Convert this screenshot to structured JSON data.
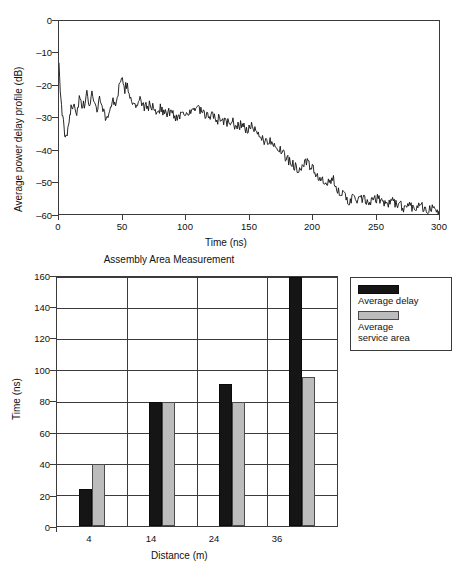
{
  "chart_data": [
    {
      "id": "power-delay-profile",
      "type": "line",
      "title": "",
      "xlabel": "Time (ns)",
      "ylabel": "Average power delay profile (dB)",
      "xlim": [
        0,
        300
      ],
      "ylim": [
        -60,
        0
      ],
      "xticks": [
        "0",
        "50",
        "100",
        "150",
        "200",
        "250",
        "300"
      ],
      "yticks": [
        "0",
        "–10",
        "–20",
        "–30",
        "–40",
        "–50",
        "–60"
      ],
      "grid": false,
      "legend": "none",
      "series": [
        {
          "name": "Average power delay profile",
          "color": "#111111",
          "description": "Noisy impulse response: sharp onset near t=0 rising from about -37 dB, a noisy plateau between -22 and -31 dB from 5 to 115 ns with a local peak near -19 dB at 50 ns, then an approximately linear decay to about -59 dB at 300 ns.",
          "x": [
            0,
            1,
            2,
            3,
            4,
            5,
            6,
            7,
            8,
            9,
            10,
            12,
            14,
            16,
            18,
            20,
            22,
            24,
            26,
            28,
            30,
            32,
            34,
            36,
            38,
            40,
            42,
            44,
            46,
            48,
            50,
            52,
            54,
            56,
            58,
            60,
            64,
            68,
            72,
            76,
            80,
            84,
            88,
            92,
            96,
            100,
            104,
            108,
            112,
            116,
            120,
            124,
            128,
            132,
            136,
            140,
            144,
            148,
            152,
            156,
            160,
            164,
            168,
            172,
            176,
            180,
            184,
            188,
            192,
            196,
            200,
            204,
            208,
            212,
            216,
            220,
            224,
            228,
            232,
            236,
            240,
            244,
            248,
            252,
            256,
            260,
            264,
            268,
            272,
            276,
            280,
            284,
            288,
            292,
            296,
            300
          ],
          "y": [
            -13,
            -22,
            -26,
            -30,
            -34,
            -37,
            -36,
            -33,
            -30,
            -28,
            -27,
            -25,
            -29,
            -24,
            -27,
            -26,
            -23,
            -26,
            -22,
            -25,
            -28,
            -24,
            -26,
            -29,
            -31,
            -27,
            -25,
            -26,
            -23,
            -20,
            -19,
            -21,
            -20,
            -23,
            -25,
            -27,
            -25,
            -27,
            -26,
            -28,
            -27,
            -29,
            -28,
            -30,
            -29,
            -28,
            -29,
            -27,
            -28,
            -30,
            -29,
            -31,
            -30,
            -32,
            -31,
            -33,
            -32,
            -34,
            -33,
            -35,
            -36,
            -38,
            -37,
            -39,
            -41,
            -43,
            -44,
            -46,
            -45,
            -44,
            -46,
            -48,
            -50,
            -51,
            -49,
            -52,
            -54,
            -56,
            -55,
            -56,
            -55,
            -57,
            -56,
            -55,
            -56,
            -57,
            -56,
            -57,
            -58,
            -57,
            -58,
            -57,
            -58,
            -59,
            -58,
            -59
          ]
        }
      ]
    },
    {
      "id": "assembly-area-measurement",
      "type": "bar",
      "title": "Assembly Area Measurement",
      "xlabel": "Distance (m)",
      "ylabel": "Time (ns)",
      "categories": [
        "4",
        "14",
        "24",
        "36"
      ],
      "ylim": [
        0,
        160
      ],
      "yticks": [
        "0",
        "20",
        "40",
        "60",
        "80",
        "100",
        "120",
        "140",
        "160"
      ],
      "grid": true,
      "legend": "right",
      "series": [
        {
          "name": "Average delay",
          "color": "#151515",
          "values": [
            24,
            80,
            91,
            160
          ]
        },
        {
          "name": "Average\nservice area",
          "color": "#bcbcbc",
          "values": [
            40,
            80,
            80,
            96
          ]
        }
      ]
    }
  ]
}
